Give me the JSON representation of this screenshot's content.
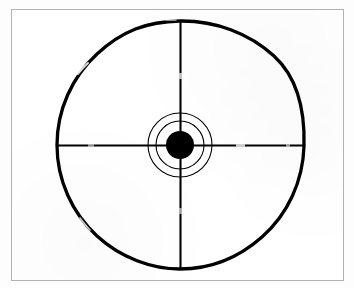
{
  "figure": {
    "name": "bullseye-target-diagram",
    "background_color": "#ffffff",
    "page_background_color": "#fdfdfd",
    "ink_color": "#000000",
    "frame_color": "#b2b2b2",
    "caption": "",
    "labels": []
  },
  "chart_data": {
    "type": "scatter",
    "xlabel": "",
    "ylabel": "",
    "grid": false,
    "legend_position": "none",
    "center": {
      "x": 180,
      "y": 145
    },
    "rings": [
      {
        "name": "outer-ring",
        "radius": 124,
        "stroke_width": 3.2,
        "fill": "none",
        "stroke": "#000000"
      },
      {
        "name": "middle-ring",
        "radius": 32,
        "stroke_width": 1.1,
        "fill": "none",
        "stroke": "#000000"
      },
      {
        "name": "inner-ring",
        "radius": 24,
        "stroke_width": 1.1,
        "fill": "none",
        "stroke": "#000000"
      },
      {
        "name": "bullseye-dot",
        "radius": 14,
        "stroke_width": 0,
        "fill": "#000000",
        "stroke": "none"
      }
    ],
    "crosshair": {
      "vertical": {
        "x": 180,
        "y_start": 21,
        "y_end": 269,
        "stroke_width": 2.1
      },
      "horizontal": {
        "y": 145,
        "x_start": 57,
        "x_end": 304,
        "stroke_width": 2.1
      }
    },
    "frame": {
      "x": 11,
      "y": 9,
      "width": 333,
      "height": 272
    }
  }
}
